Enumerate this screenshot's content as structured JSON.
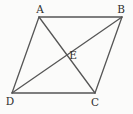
{
  "diagram": {
    "type": "geometry-figure",
    "canvas": {
      "width": 133,
      "height": 114
    },
    "colors": {
      "background": "#fbfbfa",
      "line": "#565656",
      "label": "#2e2e2e"
    },
    "stroke_width": 1.3,
    "points": {
      "A": {
        "x": 39,
        "y": 17,
        "label": "A",
        "label_x": 40,
        "label_y": 9
      },
      "B": {
        "x": 122,
        "y": 17,
        "label": "B",
        "label_x": 121,
        "label_y": 9
      },
      "C": {
        "x": 95,
        "y": 93,
        "label": "C",
        "label_x": 95,
        "label_y": 102
      },
      "D": {
        "x": 12,
        "y": 93,
        "label": "D",
        "label_x": 10,
        "label_y": 101
      },
      "E": {
        "x": 67,
        "y": 55,
        "label": "E",
        "label_x": 73,
        "label_y": 55
      }
    },
    "edges": [
      {
        "name": "side-AB",
        "from": "A",
        "to": "B"
      },
      {
        "name": "side-BC",
        "from": "B",
        "to": "C"
      },
      {
        "name": "side-CD",
        "from": "C",
        "to": "D"
      },
      {
        "name": "side-DA",
        "from": "D",
        "to": "A"
      },
      {
        "name": "diagonal-AC",
        "from": "A",
        "to": "C"
      },
      {
        "name": "diagonal-BD",
        "from": "B",
        "to": "D"
      }
    ]
  }
}
